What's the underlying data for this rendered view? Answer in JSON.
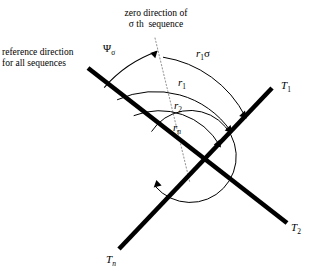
{
  "figure": {
    "type": "geometry-diagram",
    "background_color": "#ffffff",
    "stroke_color": "#000000",
    "dotted_color": "#8a8a8a"
  },
  "labels": {
    "zero_direction_line1": "zero direction of",
    "zero_direction_line2": "σ th  sequence",
    "reference_line1": "reference direction",
    "reference_line2": "for all sequences",
    "psi_base": "Ψ",
    "psi_sub": "σ",
    "arc_outer_base": "r",
    "arc_outer_sub": "1",
    "arc_outer_suffix": "σ",
    "arc_r1_base": "r",
    "arc_r1_sub": "1",
    "arc_r2_base": "r",
    "arc_r2_sub": "2",
    "arc_rn_base": "r",
    "arc_rn_sub": "n",
    "t1_base": "T",
    "t1_sub": "1",
    "t2_base": "T",
    "t2_sub": "2",
    "tn_base": "T",
    "tn_sub": "n"
  },
  "geometry": {
    "vertex_x": 185,
    "vertex_y": 163,
    "reference_start_x": 88,
    "reference_start_y": 68,
    "t1_end_x": 272,
    "t1_end_y": 88,
    "t2_end_x": 287,
    "t2_end_y": 223,
    "tn_end_x": 119,
    "tn_end_y": 249,
    "dotted_top_x": 155,
    "dotted_top_y": 38,
    "arc_radii": [
      108,
      88,
      66,
      44
    ]
  }
}
